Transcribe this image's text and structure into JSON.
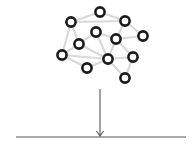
{
  "diagram": {
    "type": "network-projection",
    "colors": {
      "edge": "#d9d9d9",
      "node_stroke": "#1a1a1a",
      "node_fill": "#ffffff",
      "arrow": "#555555",
      "baseline": "#555555"
    },
    "nodes": [
      {
        "id": 0,
        "x": 100,
        "y": 12
      },
      {
        "id": 1,
        "x": 71,
        "y": 22
      },
      {
        "id": 2,
        "x": 125,
        "y": 21
      },
      {
        "id": 3,
        "x": 96,
        "y": 32
      },
      {
        "id": 4,
        "x": 143,
        "y": 36
      },
      {
        "id": 5,
        "x": 116,
        "y": 39
      },
      {
        "id": 6,
        "x": 79,
        "y": 44
      },
      {
        "id": 7,
        "x": 62,
        "y": 55
      },
      {
        "id": 8,
        "x": 108,
        "y": 59
      },
      {
        "id": 9,
        "x": 133,
        "y": 57
      },
      {
        "id": 10,
        "x": 87,
        "y": 68
      },
      {
        "id": 11,
        "x": 125,
        "y": 78
      }
    ],
    "edges": [
      [
        1,
        0
      ],
      [
        0,
        2
      ],
      [
        1,
        2
      ],
      [
        1,
        6
      ],
      [
        1,
        7
      ],
      [
        2,
        5
      ],
      [
        2,
        4
      ],
      [
        3,
        6
      ],
      [
        3,
        5
      ],
      [
        3,
        8
      ],
      [
        5,
        4
      ],
      [
        5,
        8
      ],
      [
        5,
        9
      ],
      [
        6,
        7
      ],
      [
        6,
        8
      ],
      [
        7,
        8
      ],
      [
        7,
        10
      ],
      [
        8,
        10
      ],
      [
        8,
        11
      ],
      [
        9,
        11
      ],
      [
        8,
        9
      ]
    ],
    "node_radius": 4.6,
    "arrow": {
      "x": 100,
      "y1": 89,
      "y2": 136,
      "head": 5
    },
    "baseline": {
      "x1": 16,
      "x2": 186,
      "y": 137
    }
  }
}
